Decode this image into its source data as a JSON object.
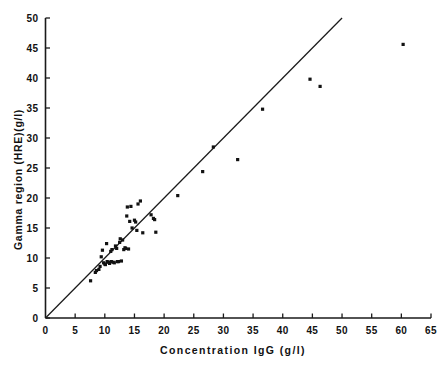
{
  "chart_data": {
    "type": "scatter",
    "title": "",
    "xlabel": "Concentration IgG (g/l)",
    "ylabel": "Gamma region (HRE)(g/l)",
    "xlim": [
      0,
      65
    ],
    "ylim": [
      0,
      50
    ],
    "xticks": [
      0,
      5,
      10,
      15,
      20,
      25,
      30,
      35,
      40,
      45,
      50,
      55,
      60,
      65
    ],
    "yticks": [
      0,
      5,
      10,
      15,
      20,
      25,
      30,
      35,
      40,
      45,
      50
    ],
    "xticklabels": [
      "0",
      "5",
      "10",
      "15",
      "20",
      "25",
      "30",
      "35",
      "40",
      "45",
      "50",
      "55",
      "60",
      "65"
    ],
    "yticklabels": [
      "0",
      "5",
      "10",
      "15",
      "20",
      "25",
      "30",
      "35",
      "40",
      "45",
      "50"
    ],
    "grid": false,
    "legend": null,
    "series": [
      {
        "name": "Samples",
        "marker": "square-dot",
        "color": "#121212",
        "points": [
          [
            7.6,
            6.2
          ],
          [
            8.4,
            7.6
          ],
          [
            8.6,
            7.9
          ],
          [
            9.0,
            8.1
          ],
          [
            9.2,
            8.6
          ],
          [
            9.4,
            10.2
          ],
          [
            9.6,
            11.3
          ],
          [
            9.8,
            9.2
          ],
          [
            10.0,
            9.0
          ],
          [
            10.1,
            8.9
          ],
          [
            10.3,
            12.4
          ],
          [
            10.4,
            9.4
          ],
          [
            10.6,
            9.3
          ],
          [
            10.8,
            9.1
          ],
          [
            11.0,
            11.1
          ],
          [
            11.1,
            9.4
          ],
          [
            11.2,
            11.4
          ],
          [
            11.4,
            9.3
          ],
          [
            11.6,
            9.2
          ],
          [
            11.8,
            12.0
          ],
          [
            12.0,
            11.6
          ],
          [
            12.1,
            9.4
          ],
          [
            12.3,
            9.4
          ],
          [
            12.5,
            12.6
          ],
          [
            12.6,
            13.2
          ],
          [
            12.8,
            9.5
          ],
          [
            13.0,
            13.0
          ],
          [
            13.2,
            11.4
          ],
          [
            13.4,
            11.7
          ],
          [
            13.5,
            11.6
          ],
          [
            13.7,
            17.0
          ],
          [
            13.8,
            18.5
          ],
          [
            14.0,
            11.5
          ],
          [
            14.2,
            16.1
          ],
          [
            14.4,
            18.6
          ],
          [
            14.6,
            15.0
          ],
          [
            15.0,
            16.3
          ],
          [
            15.2,
            16.0
          ],
          [
            15.4,
            14.6
          ],
          [
            15.6,
            19.0
          ],
          [
            16.0,
            19.5
          ],
          [
            16.4,
            14.2
          ],
          [
            17.8,
            17.2
          ],
          [
            18.2,
            16.6
          ],
          [
            18.4,
            16.4
          ],
          [
            18.6,
            14.3
          ],
          [
            22.3,
            20.4
          ],
          [
            26.5,
            24.4
          ],
          [
            28.3,
            28.5
          ],
          [
            32.4,
            26.4
          ],
          [
            36.6,
            34.8
          ],
          [
            44.6,
            39.8
          ],
          [
            46.3,
            38.6
          ],
          [
            60.3,
            45.6
          ]
        ]
      }
    ],
    "fit_line": {
      "name": "Identity/regression line",
      "color": "#1a1a1a",
      "x_start": 0,
      "y_start": 0,
      "x_end": 50.0,
      "y_end": 50.0
    }
  }
}
